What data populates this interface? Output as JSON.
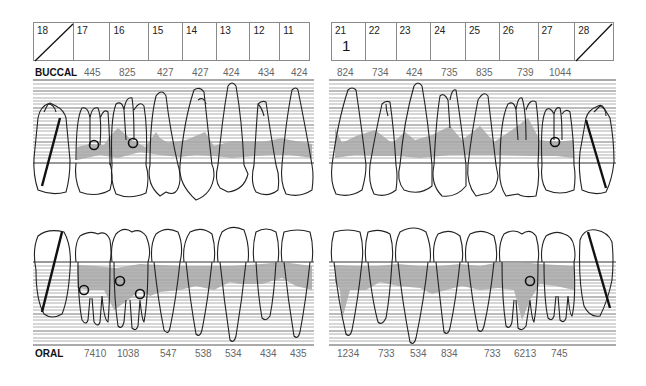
{
  "upper_teeth_right": [
    {
      "number": "18",
      "missing": true,
      "mark": ""
    },
    {
      "number": "17",
      "missing": false,
      "mark": ""
    },
    {
      "number": "16",
      "missing": false,
      "mark": ""
    },
    {
      "number": "15",
      "missing": false,
      "mark": ""
    },
    {
      "number": "14",
      "missing": false,
      "mark": ""
    },
    {
      "number": "13",
      "missing": false,
      "mark": ""
    },
    {
      "number": "12",
      "missing": false,
      "mark": ""
    },
    {
      "number": "11",
      "missing": false,
      "mark": ""
    }
  ],
  "upper_teeth_left": [
    {
      "number": "21",
      "missing": false,
      "mark": "1"
    },
    {
      "number": "22",
      "missing": false,
      "mark": ""
    },
    {
      "number": "23",
      "missing": false,
      "mark": ""
    },
    {
      "number": "24",
      "missing": false,
      "mark": ""
    },
    {
      "number": "25",
      "missing": false,
      "mark": ""
    },
    {
      "number": "26",
      "missing": false,
      "mark": ""
    },
    {
      "number": "27",
      "missing": false,
      "mark": ""
    },
    {
      "number": "28",
      "missing": true,
      "mark": ""
    }
  ],
  "buccal": {
    "label": "BUCCAL",
    "right_values": [
      "445",
      "825",
      "427",
      "427",
      "424",
      "434",
      "424"
    ],
    "left_values": [
      "824",
      "734",
      "424",
      "735",
      "835",
      "739",
      "1044"
    ]
  },
  "oral": {
    "label": "ORAL",
    "right_values": [
      "7410",
      "1038",
      "547",
      "538",
      "534",
      "434",
      "435"
    ],
    "left_values": [
      "1234",
      "733",
      "534",
      "834",
      "733",
      "6213",
      "745"
    ]
  },
  "colors": {
    "line": "#222222",
    "grid": "#9a9a9a",
    "pocket_fill": "#a8a8a8",
    "box_border": "#8a8a8a"
  },
  "furcation_markers": {
    "buccal": [
      "17",
      "16",
      "27"
    ],
    "oral": [
      "17",
      "16a",
      "16b",
      "26"
    ]
  }
}
